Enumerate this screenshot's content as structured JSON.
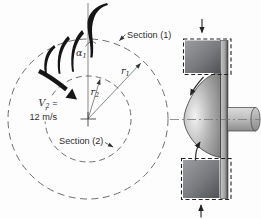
{
  "figure": {
    "left_view": {
      "section1_label": "Section (1)",
      "section2_label": "Section (2)",
      "r1": {
        "base": "r",
        "sub": "1"
      },
      "r2": {
        "base": "r",
        "sub": "2"
      },
      "alpha1": {
        "base": "α",
        "sub": "1"
      },
      "v2": {
        "base": "V",
        "sub": "2",
        "eq": " =",
        "value": "12 m/s"
      }
    }
  },
  "colors": {
    "ink": "#151515",
    "dash_gray": "#6e6e6e",
    "block_light": "#9b9da0",
    "block_dark": "#4f5154",
    "plate_light": "#c6c6c6",
    "plate_dark": "#4a4a4a",
    "bell_highlight": "#f3f3f3",
    "bell_mid": "#ababab",
    "bell_dark": "#7a7a7a",
    "shaft_light": "#dcdcdc",
    "shaft_dark": "#8c8c8c",
    "text": "#2e2e2e"
  }
}
